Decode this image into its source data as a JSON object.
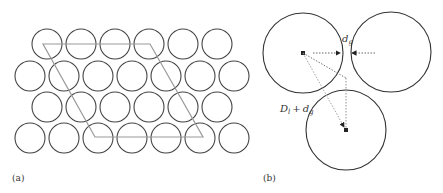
{
  "panels": {
    "a": {
      "label": "(a)",
      "circle_radius": 15,
      "circle_stroke": "#444444",
      "lattice_stroke": "#999999",
      "rows": [
        {
          "y": 44,
          "x_start": 47,
          "count": 6
        },
        {
          "y": 76,
          "x_start": 30,
          "count": 7
        },
        {
          "y": 107,
          "x_start": 47,
          "count": 6
        },
        {
          "y": 138,
          "x_start": 30,
          "count": 7
        }
      ],
      "spacing": 34,
      "unit_cell": [
        [
          43,
          44
        ],
        [
          150,
          44
        ],
        [
          203,
          137
        ],
        [
          95,
          137
        ]
      ]
    },
    "b": {
      "label": "(b)",
      "gap_label": {
        "main": "d",
        "sub": "g"
      },
      "distance_label": {
        "D": "D",
        "D_sub": "l",
        "plus": "+",
        "d": "d",
        "d_sub": "g"
      },
      "circles": [
        {
          "cx": 303,
          "cy": 53,
          "r": 40
        },
        {
          "cx": 391,
          "cy": 52,
          "r": 40
        },
        {
          "cx": 346,
          "cy": 130,
          "r": 40
        }
      ],
      "circle_stroke": "#333333",
      "arrow_stroke": "#555555"
    }
  }
}
